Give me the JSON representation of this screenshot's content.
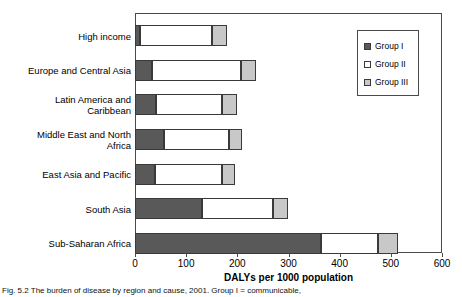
{
  "chart_data": {
    "type": "bar",
    "orientation": "horizontal",
    "stacked": true,
    "title": "",
    "xlabel": "DALYs per 1000 population",
    "ylabel": "",
    "xlim": [
      0,
      600
    ],
    "xticks": [
      0,
      100,
      200,
      300,
      400,
      500,
      600
    ],
    "xtick_labels": [
      "0",
      "100",
      "200",
      "300",
      "400",
      "500",
      "600"
    ],
    "grid": false,
    "legend_position": "upper right",
    "categories": [
      "High income",
      "Europe and Central Asia",
      "Latin America and\nCaribbean",
      "Middle East and North\nAfrica",
      "East Asia and Pacific",
      "South Asia",
      "Sub-Saharan Africa"
    ],
    "series": [
      {
        "name": "Group I",
        "color": "#595959",
        "values": [
          10,
          33,
          41,
          57,
          39,
          131,
          363
        ]
      },
      {
        "name": "Group II",
        "color": "#ffffff",
        "values": [
          140,
          174,
          129,
          127,
          131,
          139,
          112
        ]
      },
      {
        "name": "Group III",
        "color": "#c8c8c8",
        "values": [
          29,
          29,
          29,
          25,
          25,
          29,
          40
        ]
      }
    ],
    "totals": [
      179,
      236,
      199,
      209,
      195,
      299,
      515
    ]
  },
  "legend": {
    "items": [
      {
        "label": "Group I",
        "swatch": "dark-gray-swatch"
      },
      {
        "label": "Group II",
        "swatch": "white-swatch"
      },
      {
        "label": "Group III",
        "swatch": "light-gray-swatch"
      }
    ]
  },
  "caption": {
    "label": "Fig. 5.2",
    "text": "Fig. 5.2  The burden of disease by region and cause, 2001. Group I = communicable,"
  }
}
